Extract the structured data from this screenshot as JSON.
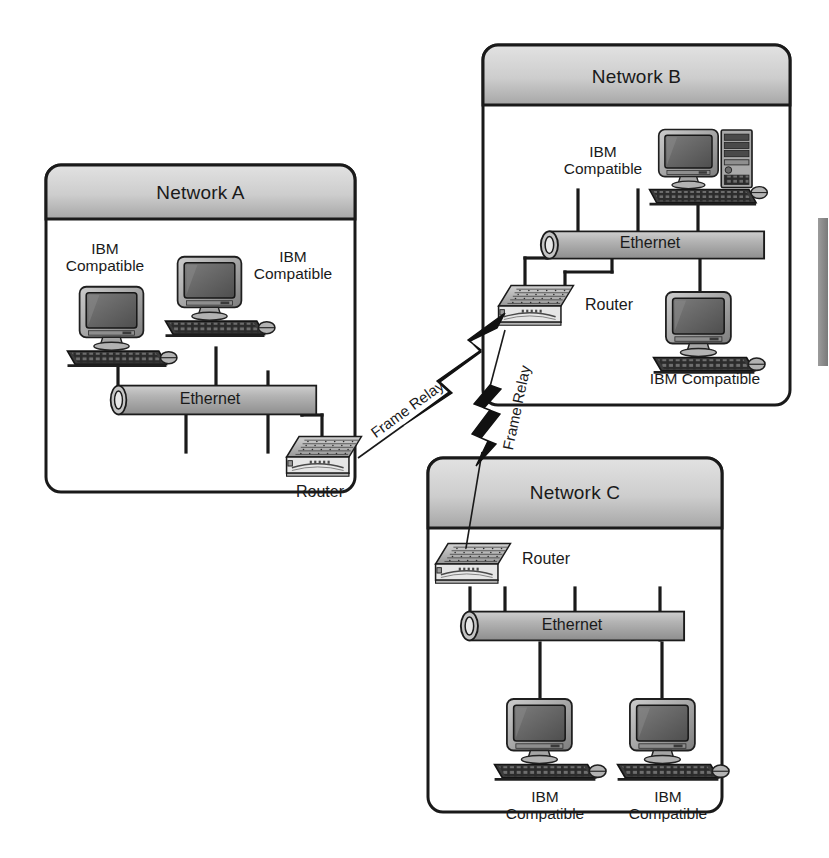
{
  "diagram": {
    "colors": {
      "outline": "#1a1a1a",
      "header_fill_top": "#d8d8d8",
      "header_fill_bottom": "#a8a8a8",
      "body_fill": "#ffffff",
      "ethernet_fill": "#b0b0b0",
      "device_gray": "#9a9a9a",
      "screen_dark": "#5a5a5a",
      "bolt_fill": "#111111",
      "sidebar_gray": "#8c8c8c"
    }
  },
  "networks": [
    {
      "id": "network-a",
      "title": "Network A",
      "bus_label": "Ethernet",
      "router_label": "Router",
      "hosts": [
        {
          "label": "IBM\nCompatible"
        },
        {
          "label": "IBM\nCompatible"
        }
      ]
    },
    {
      "id": "network-b",
      "title": "Network B",
      "bus_label": "Ethernet",
      "router_label": "Router",
      "hosts": [
        {
          "label": "IBM\nCompatible"
        },
        {
          "label": "IBM Compatible"
        }
      ]
    },
    {
      "id": "network-c",
      "title": "Network C",
      "bus_label": "Ethernet",
      "router_label": "Router",
      "hosts": [
        {
          "label": "IBM\nCompatible"
        },
        {
          "label": "IBM\nCompatible"
        }
      ]
    }
  ],
  "links": [
    {
      "id": "link-a-b",
      "label": "Frame Relay",
      "from": "network-a-router",
      "to": "network-b-router"
    },
    {
      "id": "link-b-c",
      "label": "Frame Relay",
      "from": "network-b-router",
      "to": "network-c-router"
    }
  ]
}
